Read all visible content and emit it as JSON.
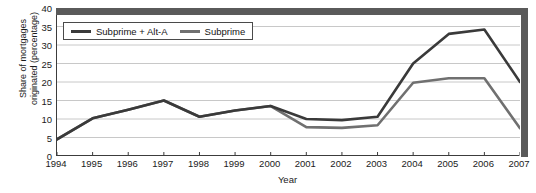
{
  "chart_data": {
    "type": "line",
    "title": "",
    "xlabel": "Year",
    "ylabel": "Share of mortgages originated (percentage)",
    "x": [
      1994,
      1995,
      1996,
      1997,
      1998,
      1999,
      2000,
      2001,
      2002,
      2003,
      2004,
      2005,
      2006,
      2007
    ],
    "categories": [
      "1994",
      "1995",
      "1996",
      "1997",
      "1998",
      "1999",
      "2000",
      "2001",
      "2002",
      "2003",
      "2004",
      "2005",
      "2006",
      "2007"
    ],
    "series": [
      {
        "name": "Subprime + Alt-A",
        "color": "#3a3a3a",
        "values": [
          4.5,
          10.2,
          12.5,
          15.0,
          10.6,
          12.3,
          13.5,
          10.0,
          9.7,
          10.6,
          25.0,
          33.0,
          34.2,
          20.0
        ]
      },
      {
        "name": "Subprime",
        "color": "#707070",
        "values": [
          4.5,
          10.2,
          12.5,
          15.0,
          10.6,
          12.3,
          13.5,
          7.8,
          7.6,
          8.3,
          19.8,
          21.0,
          21.0,
          7.5
        ]
      }
    ],
    "ylim": [
      0,
      40
    ],
    "yticks": [
      0,
      5,
      10,
      15,
      20,
      25,
      30,
      35,
      40
    ],
    "ytick_labels": [
      "0",
      "5",
      "10",
      "15",
      "20",
      "25",
      "30",
      "35",
      "40"
    ],
    "xlim": [
      1994,
      2007
    ],
    "grid": "horizontal",
    "grid_color": "#c8c8c8",
    "legend_position": "top-left",
    "frame_color": "#5a5a5a",
    "axis_color": "#3c3c3c"
  },
  "legend": {
    "entries": [
      {
        "label": "Subprime + Alt-A"
      },
      {
        "label": "Subprime"
      }
    ]
  },
  "axes": {
    "x_title": "Year",
    "y_title": "Share of mortgages\noriginated (percentage)"
  }
}
